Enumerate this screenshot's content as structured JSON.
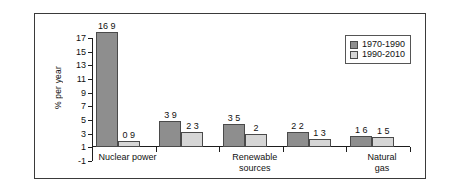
{
  "chart_data": {
    "type": "bar",
    "title": "",
    "xlabel": "",
    "ylabel": "% per year",
    "ylim": [
      -1,
      17
    ],
    "yticks": [
      -1,
      1,
      3,
      5,
      7,
      9,
      11,
      13,
      15,
      17
    ],
    "grid": false,
    "legend_position": "top-right",
    "categories": [
      "Nuclear power",
      "Renewable\nsources",
      "Natural\ngas",
      "Coal",
      "Oil"
    ],
    "series": [
      {
        "name": "1970-1990",
        "color": "#8e8e8e",
        "values": [
          16.9,
          3.9,
          3.5,
          2.2,
          1.6
        ],
        "labels": [
          "16 9",
          "3 9",
          "3 5",
          "2 2",
          "1 6"
        ]
      },
      {
        "name": "1990-2010",
        "color": "#d6d6d6",
        "values": [
          0.9,
          2.3,
          2.0,
          1.3,
          1.5
        ],
        "labels": [
          "0 9",
          "2 3",
          "2",
          "1 3",
          "1 5"
        ]
      }
    ]
  },
  "colors": {
    "series_1970_1990": "#8e8e8e",
    "series_1990_2010": "#d6d6d6",
    "axis": "#1d1d1d",
    "frame": "#3a3a3a",
    "background": "#ffffff"
  }
}
